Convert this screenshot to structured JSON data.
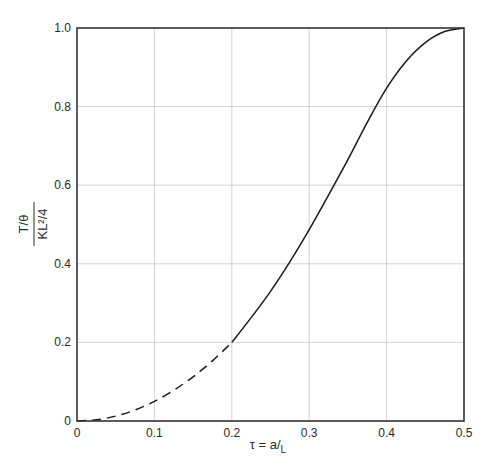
{
  "chart_data": {
    "type": "line",
    "title": "",
    "xlabel": "τ = a/L",
    "xlabel_parts": {
      "main": "τ = a/",
      "sub": "L"
    },
    "ylabel": "(T/θ) / (KL²/4)",
    "ylabel_parts": {
      "numerator": "T/θ",
      "denominator": "KL²/4"
    },
    "xlim": [
      0,
      0.5
    ],
    "ylim": [
      0,
      1.0
    ],
    "xticks": [
      0,
      0.1,
      0.2,
      0.3,
      0.4,
      0.5
    ],
    "xtick_labels": [
      "0",
      "0.1",
      "0.2",
      "0.3",
      "0.4",
      "0.5"
    ],
    "yticks": [
      0,
      0.2,
      0.4,
      0.6,
      0.8,
      1.0
    ],
    "ytick_labels": [
      "0",
      "0.2",
      "0.4",
      "0.6",
      "0.8",
      "1.0"
    ],
    "grid": true,
    "legend": null,
    "series": [
      {
        "name": "dashed segment",
        "style": "dashed",
        "x": [
          0,
          0.025,
          0.05,
          0.075,
          0.1,
          0.125,
          0.15,
          0.175,
          0.2
        ],
        "y": [
          0,
          0.003,
          0.0125,
          0.028,
          0.05,
          0.078,
          0.1125,
          0.153,
          0.2
        ]
      },
      {
        "name": "solid segment",
        "style": "solid",
        "x": [
          0.2,
          0.225,
          0.25,
          0.275,
          0.3,
          0.325,
          0.35,
          0.375,
          0.4,
          0.425,
          0.45,
          0.475,
          0.5
        ],
        "y": [
          0.2,
          0.263,
          0.33,
          0.405,
          0.487,
          0.575,
          0.665,
          0.76,
          0.847,
          0.915,
          0.963,
          0.991,
          1.0
        ]
      }
    ]
  },
  "colors": {
    "curve": "#1a1a1a",
    "grid": "#c8c8c8",
    "frame": "#333333",
    "text": "#2a2a2a"
  }
}
